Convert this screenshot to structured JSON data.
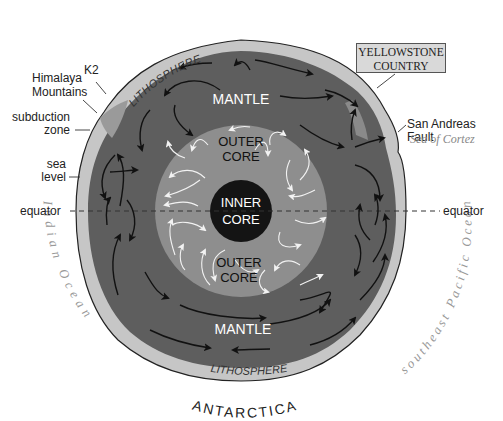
{
  "diagram": {
    "colors": {
      "background": "#ffffff",
      "crust_outer": "#bfbfbf",
      "lithosphere": "#c8c8c8",
      "mantle": "#5e5e5e",
      "outer_core": "#8e8e8e",
      "inner_core": "#141414",
      "mantle_arrows": "#111111",
      "core_arrows": "#f2f2f2",
      "yellowstone_box": "#d9d9d9"
    },
    "layers": {
      "lithosphere_top": "LITHOSPHERE",
      "lithosphere_bottom": "LITHOSPHERE",
      "mantle_top": "MANTLE",
      "mantle_bottom": "MANTLE",
      "outer_core_top_line1": "OUTER",
      "outer_core_top_line2": "CORE",
      "outer_core_bottom_line1": "OUTER",
      "outer_core_bottom_line2": "CORE",
      "inner_core_line1": "INNER",
      "inner_core_line2": "CORE"
    },
    "oceans": {
      "top": "Arctic Ocean",
      "left": "Indian Ocean",
      "right": "southeast Pacific Ocean",
      "bottom": "ANTARCTICA"
    },
    "callouts": {
      "k2": "K2",
      "himalaya_line1": "Himalaya",
      "himalaya_line2": "Mountains",
      "subduction_line1": "subduction",
      "subduction_line2": "zone",
      "sea_level_line1": "sea",
      "sea_level_line2": "level",
      "equator_left": "equator",
      "equator_right": "equator",
      "yellowstone_line1": "YELLOWSTONE",
      "yellowstone_line2": "COUNTRY",
      "san_andreas": "San Andreas Fault",
      "sea_of_cortez": "Sea of Cortez"
    }
  }
}
